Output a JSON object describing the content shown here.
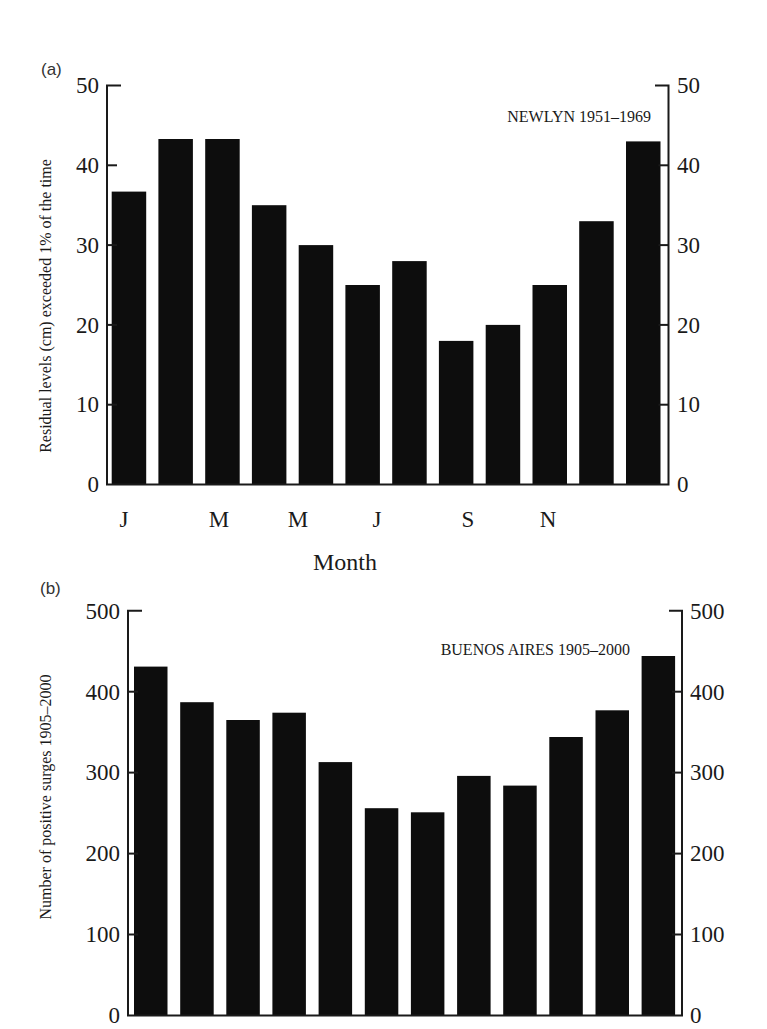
{
  "chart_data": [
    {
      "panel": "(a)",
      "type": "bar",
      "title": "NEWLYN 1951–1969",
      "xlabel": "Month",
      "ylabel": "Residual levels (cm) exceeded 1% of the time",
      "categories": [
        "Jan",
        "Feb",
        "Mar",
        "Apr",
        "May",
        "Jun",
        "Jul",
        "Aug",
        "Sep",
        "Oct",
        "Nov",
        "Dec"
      ],
      "x_tick_labels": [
        "J",
        "M",
        "M",
        "J",
        "S",
        "N"
      ],
      "values": [
        36.7,
        43.3,
        43.3,
        35,
        30,
        25,
        28,
        18,
        20,
        25,
        33,
        43
      ],
      "ylim": [
        0,
        50
      ],
      "yticks": [
        0,
        10,
        20,
        30,
        40,
        50
      ],
      "right_axis_mirror": true,
      "grid": false,
      "bar_color": "#0d0d0d"
    },
    {
      "panel": "(b)",
      "type": "bar",
      "title": "BUENOS AIRES 1905–2000",
      "xlabel": "",
      "ylabel": "Number of positive surges 1905–2000",
      "categories": [
        "Jan",
        "Feb",
        "Mar",
        "Apr",
        "May",
        "Jun",
        "Jul",
        "Aug",
        "Sep",
        "Oct",
        "Nov",
        "Dec"
      ],
      "values": [
        431,
        387,
        365,
        374,
        313,
        256,
        251,
        296,
        284,
        344,
        377,
        444
      ],
      "ylim": [
        0,
        500
      ],
      "yticks": [
        0,
        100,
        200,
        300,
        400,
        500
      ],
      "right_axis_mirror": true,
      "grid": false,
      "bar_color": "#0d0d0d"
    }
  ],
  "panels": {
    "a": {
      "label": "(a)",
      "title": "NEWLYN 1951–1969",
      "ylabel": "Residual levels (cm) exceeded 1% of the time",
      "xlabel": "Month",
      "yticks": [
        "0",
        "10",
        "20",
        "30",
        "40",
        "50"
      ],
      "xticks": [
        "J",
        "M",
        "M",
        "J",
        "S",
        "N"
      ]
    },
    "b": {
      "label": "(b)",
      "title": "BUENOS AIRES 1905–2000",
      "ylabel": "Number of positive surges 1905–2000",
      "yticks": [
        "0",
        "100",
        "200",
        "300",
        "400",
        "500"
      ]
    }
  }
}
